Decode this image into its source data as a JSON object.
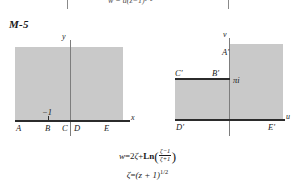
{
  "plate": {
    "label": "M-5"
  },
  "top_formula": {
    "text": "w = a(z−1)¹ᐟ²"
  },
  "z_plane": {
    "axis_x_label": "x",
    "axis_y_label": "y",
    "marker_label": "−1",
    "boundary_points": [
      {
        "id": "A",
        "label": "A"
      },
      {
        "id": "B",
        "label": "B"
      },
      {
        "id": "C",
        "label": "C"
      },
      {
        "id": "D",
        "label": "D"
      },
      {
        "id": "E",
        "label": "E"
      }
    ]
  },
  "w_plane": {
    "axis_u_label": "u",
    "axis_v_label": "v",
    "marker_label": "πi",
    "boundary_points": [
      {
        "id": "A1",
        "label": "A′"
      },
      {
        "id": "B1",
        "label": "B′"
      },
      {
        "id": "C1",
        "label": "C′"
      },
      {
        "id": "D1",
        "label": "D′"
      },
      {
        "id": "E1",
        "label": "E′"
      }
    ]
  },
  "mapping": {
    "line1": {
      "lhs": "w",
      "eq": "=",
      "coef": "2",
      "zeta": "ζ",
      "plus": "+",
      "ln": "Ln",
      "num": "ζ−1",
      "den": "ζ+1"
    },
    "line2": {
      "lhs": "ζ",
      "eq": "=",
      "rhs": "(z + 1)",
      "exp": "1/2"
    }
  },
  "colors": {
    "shade": "#c9c9c9",
    "edge": "#2b2b2b",
    "axis": "#7d7d7d"
  }
}
